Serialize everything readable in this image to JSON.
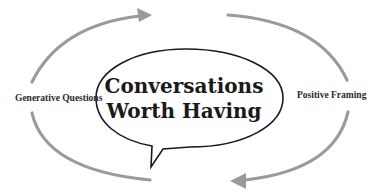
{
  "diagram": {
    "center_title_line1": "Conversations",
    "center_title_line2": "Worth Having",
    "left_label": "Generative Questions",
    "right_label": "Positive Framing",
    "colors": {
      "arrow": "#9a9a9a",
      "bubble_stroke": "#1a1a1a",
      "text": "#1a1a1a",
      "background": "#ffffff"
    },
    "arrows": [
      {
        "position": "top-left",
        "direction": "clockwise",
        "points_to": "top-center"
      },
      {
        "position": "top-right",
        "direction": "clockwise",
        "points_to": "right"
      },
      {
        "position": "bottom-right",
        "direction": "clockwise",
        "points_to": "bottom-center"
      },
      {
        "position": "bottom-left",
        "direction": "clockwise",
        "points_to": "left"
      }
    ]
  }
}
